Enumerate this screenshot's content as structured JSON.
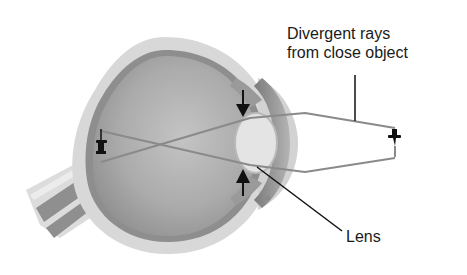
{
  "diagram": {
    "labels": {
      "rays_line1": "Divergent rays",
      "rays_line2": "from close object",
      "lens": "Lens"
    },
    "elements": {
      "object": "pushpin-upright",
      "image": "pushpin-inverted-on-retina",
      "arrows": [
        "ciliary-compression-down",
        "ciliary-compression-up"
      ]
    },
    "colors": {
      "background": "#ffffff",
      "sclera": "#d9d9d9",
      "choroid": "#8c8c8c",
      "vitreous": "#a8a8a8",
      "lens": "#e6e6e6",
      "ray": "#8a8a8a",
      "ink": "#111111"
    }
  }
}
